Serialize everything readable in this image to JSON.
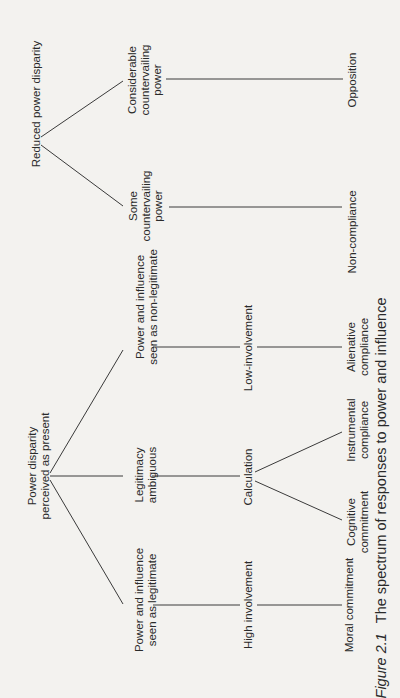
{
  "diagram": {
    "title": "The spectrum of responses to power and influence",
    "figure_label": "Figure 2.1",
    "roots": {
      "reduced": "Reduced power disparity",
      "present": "Power disparity\nperceived as present"
    },
    "perceptions": {
      "considerable": "Considerable\ncountervailing\npower",
      "some": "Some\ncountervailing\npower",
      "non_legitimate": "Power and influence\nseen as non-legitimate",
      "ambiguous": "Legitimacy\nambiguous",
      "legitimate": "Power and influence\nseen as legitimate"
    },
    "involvement": {
      "low": "Low-involvement",
      "calculation": "Calculation",
      "high": "High involvement"
    },
    "responses": {
      "opposition": "Opposition",
      "non_compliance": "Non-compliance",
      "alienative": "Alienative\ncompliance",
      "instrumental": "Instrumental\ncompliance",
      "cognitive": "Cognitive\ncommitment",
      "moral": "Moral commitment"
    },
    "line_color": "#3a3a3a"
  }
}
